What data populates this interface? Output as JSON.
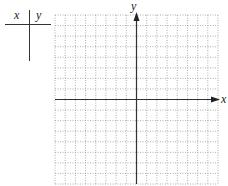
{
  "table": {
    "x_header": "x",
    "y_header": "y",
    "rows": []
  },
  "graph": {
    "x_axis_label": "x",
    "y_axis_label": "y",
    "columns": 16,
    "rows": 16,
    "grid_style": "dotted",
    "axis_color": "#333333",
    "grid_color": "#9a9a9a"
  }
}
